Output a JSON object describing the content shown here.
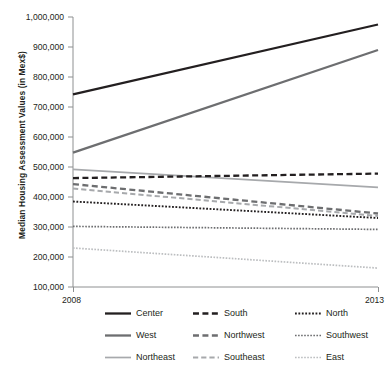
{
  "chart_data": {
    "type": "line",
    "title": "",
    "xlabel": "",
    "ylabel": "Median Housing Assessment Values (in Mex$)",
    "x": [
      2008,
      2013
    ],
    "xtick_labels": [
      "2008",
      "2013"
    ],
    "xlim": [
      2008,
      2013
    ],
    "ylim": [
      100000,
      1000000
    ],
    "ytick_labels": [
      "100,000",
      "200,000",
      "300,000",
      "400,000",
      "500,000",
      "600,000",
      "700,000",
      "800,000",
      "900,000",
      "1,000,000"
    ],
    "ytick_values": [
      100000,
      200000,
      300000,
      400000,
      500000,
      600000,
      700000,
      800000,
      900000,
      1000000
    ],
    "grid": false,
    "legend_position": "bottom",
    "series": [
      {
        "name": "Center",
        "values": [
          742000,
          975000
        ],
        "style": "solid",
        "color": "#231f20",
        "width": 2.3
      },
      {
        "name": "West",
        "values": [
          548000,
          890000
        ],
        "style": "solid",
        "color": "#6d6e70",
        "width": 2.3
      },
      {
        "name": "Northeast",
        "values": [
          492000,
          432000
        ],
        "style": "solid",
        "color": "#a7a9ac",
        "width": 1.7
      },
      {
        "name": "South",
        "values": [
          463000,
          478000
        ],
        "style": "dashed",
        "color": "#231f20",
        "width": 2.3
      },
      {
        "name": "Northwest",
        "values": [
          443000,
          345000
        ],
        "style": "dashed",
        "color": "#6d6e70",
        "width": 2.3
      },
      {
        "name": "Southeast",
        "values": [
          428000,
          337000
        ],
        "style": "dashed",
        "color": "#a7a9ac",
        "width": 2.0
      },
      {
        "name": "North",
        "values": [
          385000,
          330000
        ],
        "style": "dotted",
        "color": "#231f20",
        "width": 1.9
      },
      {
        "name": "Southwest",
        "values": [
          302000,
          292000
        ],
        "style": "dotted",
        "color": "#6d6e70",
        "width": 1.7
      },
      {
        "name": "East",
        "values": [
          230000,
          163000
        ],
        "style": "dotted",
        "color": "#bcbec0",
        "width": 1.7
      }
    ]
  },
  "legend": {
    "entries": [
      {
        "label": "Center"
      },
      {
        "label": "South"
      },
      {
        "label": "North"
      },
      {
        "label": "West"
      },
      {
        "label": "Northwest"
      },
      {
        "label": "Southwest"
      },
      {
        "label": "Northeast"
      },
      {
        "label": "Southeast"
      },
      {
        "label": "East"
      }
    ]
  },
  "axes": {
    "axis_color": "#8e9091"
  }
}
